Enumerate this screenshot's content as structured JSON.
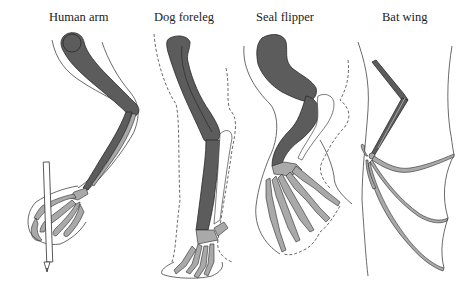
{
  "diagram": {
    "colors": {
      "background": "#ffffff",
      "dark_bone": "#5c5c5c",
      "light_bone": "#a9a9a9",
      "outline": "#333333"
    },
    "panels": [
      {
        "id": "human",
        "label": "Human arm"
      },
      {
        "id": "dog",
        "label": "Dog foreleg"
      },
      {
        "id": "seal",
        "label": "Seal flipper"
      },
      {
        "id": "bat",
        "label": "Bat wing"
      }
    ]
  }
}
